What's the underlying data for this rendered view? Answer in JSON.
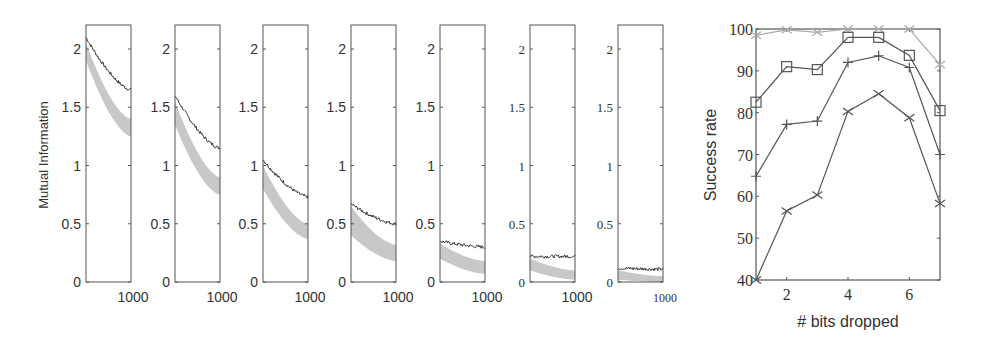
{
  "chart_data": [
    {
      "type": "line",
      "title": "",
      "ylabel": "Mutual Information",
      "xlabel": "",
      "panel_count": 7,
      "ylim": [
        0,
        2.2
      ],
      "xlim": [
        0,
        1000
      ],
      "yticks": [
        "0",
        "0.5",
        "1",
        "1.5",
        "2"
      ],
      "xtick_label": "1000",
      "grid": false,
      "legend": null,
      "series_description": [
        "dark line (observed)",
        "gray band (baseline)"
      ],
      "panels": [
        {
          "index": 1,
          "dark_start": 2.1,
          "dark_end": 1.65,
          "band_start": [
            1.9,
            2.05
          ],
          "band_end": [
            1.25,
            1.4
          ]
        },
        {
          "index": 2,
          "dark_start": 1.6,
          "dark_end": 1.15,
          "band_start": [
            1.35,
            1.55
          ],
          "band_end": [
            0.75,
            0.9
          ]
        },
        {
          "index": 3,
          "dark_start": 1.05,
          "dark_end": 0.73,
          "band_start": [
            0.8,
            1.0
          ],
          "band_end": [
            0.37,
            0.5
          ]
        },
        {
          "index": 4,
          "dark_start": 0.67,
          "dark_end": 0.5,
          "band_start": [
            0.4,
            0.65
          ],
          "band_end": [
            0.18,
            0.32
          ]
        },
        {
          "index": 5,
          "dark_start": 0.35,
          "dark_end": 0.3,
          "band_start": [
            0.2,
            0.33
          ],
          "band_end": [
            0.07,
            0.18
          ]
        },
        {
          "index": 6,
          "dark_start": 0.22,
          "dark_end": 0.22,
          "band_start": [
            0.1,
            0.2
          ],
          "band_end": [
            0.02,
            0.1
          ]
        },
        {
          "index": 7,
          "dark_start": 0.12,
          "dark_end": 0.11,
          "band_start": [
            0.02,
            0.1
          ],
          "band_end": [
            0.0,
            0.05
          ]
        }
      ]
    },
    {
      "type": "line",
      "title": "",
      "xlabel": "# bits dropped",
      "ylabel": "Success rate",
      "xlim": [
        1,
        7
      ],
      "ylim": [
        40,
        100
      ],
      "xticks": [
        "2",
        "4",
        "6"
      ],
      "yticks": [
        "40",
        "50",
        "60",
        "70",
        "80",
        "90",
        "100"
      ],
      "grid": false,
      "legend": null,
      "x": [
        1,
        2,
        3,
        4,
        5,
        6,
        7
      ],
      "series": [
        {
          "name": "light x series",
          "marker": "x",
          "color": "#aaaaaa",
          "values": [
            98.5,
            99.8,
            99.2,
            100,
            100,
            100,
            91.5
          ]
        },
        {
          "name": "square series",
          "marker": "square",
          "color": "#555555",
          "values": [
            82.5,
            91,
            90.3,
            98,
            98,
            93.7,
            80.5
          ]
        },
        {
          "name": "plus series",
          "marker": "plus",
          "color": "#555555",
          "values": [
            64.8,
            77.2,
            78,
            92,
            93.6,
            90.8,
            70
          ]
        },
        {
          "name": "x series",
          "marker": "x",
          "color": "#555555",
          "values": [
            40,
            56.5,
            60.3,
            80.3,
            84.5,
            78.8,
            58.3
          ]
        }
      ]
    }
  ]
}
